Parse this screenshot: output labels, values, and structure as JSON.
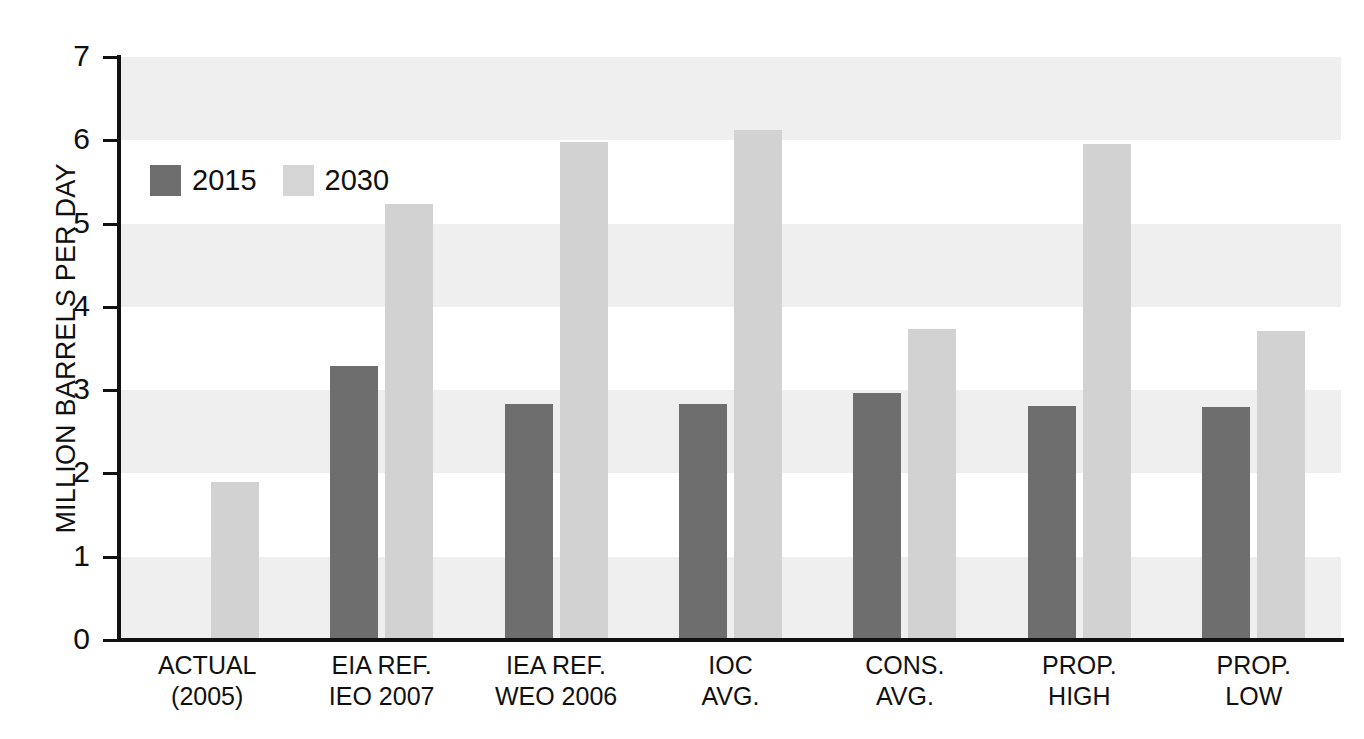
{
  "chart_data": {
    "type": "bar",
    "title": "",
    "xlabel": "",
    "ylabel": "MILLION BARRELS PER DAY",
    "ylim": [
      0,
      7
    ],
    "yticks": [
      "0",
      "1",
      "2",
      "3",
      "4",
      "5",
      "6",
      "7"
    ],
    "grid": "horizontal alternating shaded bands, no gridlines",
    "legend": {
      "position": "inside top-left",
      "entries": [
        {
          "name": "2015",
          "color": "#6e6e6e"
        },
        {
          "name": "2030",
          "color": "#d5d5d5"
        }
      ]
    },
    "categories": [
      {
        "line1": "ACTUAL",
        "line2": "(2005)"
      },
      {
        "line1": "EIA REF.",
        "line2": "IEO 2007"
      },
      {
        "line1": "IEA REF.",
        "line2": "WEO 2006"
      },
      {
        "line1": "IOC",
        "line2": "AVG."
      },
      {
        "line1": "CONS.",
        "line2": "AVG."
      },
      {
        "line1": "PROP.",
        "line2": "HIGH"
      },
      {
        "line1": "PROP.",
        "line2": "LOW"
      }
    ],
    "series": [
      {
        "name": "2015",
        "color": "#6e6e6e",
        "values": [
          null,
          3.29,
          2.83,
          2.83,
          2.97,
          2.81,
          2.8
        ]
      },
      {
        "name": "2030",
        "color": "#d2d2d2",
        "values": [
          1.9,
          5.23,
          5.98,
          6.12,
          3.73,
          5.95,
          3.71
        ]
      }
    ]
  },
  "colors": {
    "series_2015": "#6e6e6e",
    "series_2030": "#d2d2d2",
    "band": "#efefef",
    "axis": "#111111",
    "text": "#101010",
    "background": "#ffffff"
  },
  "footnote": {
    "text": ""
  }
}
